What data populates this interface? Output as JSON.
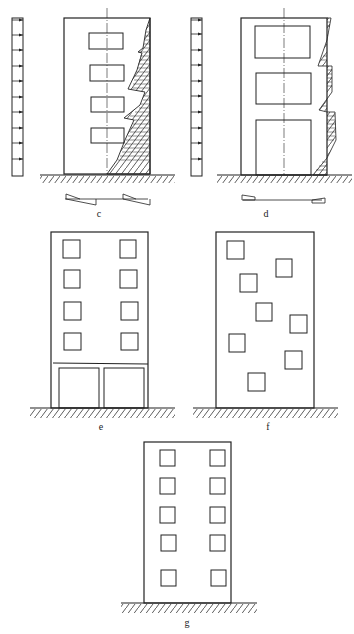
{
  "figure": {
    "panels": [
      {
        "id": "c",
        "label": "c",
        "description": "Frame wall with four small openings; wind load arrows on left, stress distribution diagram on right edge, section stress diagrams below"
      },
      {
        "id": "d",
        "label": "d",
        "description": "Wall with two large openings and tall door opening; wind load arrows on left, stress distribution diagram on right edge, section stress diagrams below"
      },
      {
        "id": "e",
        "label": "e",
        "description": "Building elevation with 2x4 regular windows and open ground floor (two large bays)"
      },
      {
        "id": "f",
        "label": "f",
        "description": "Building elevation with irregularly staggered windows"
      },
      {
        "id": "g",
        "label": "g",
        "description": "Building elevation with 2x5 regular window arrangement"
      }
    ]
  }
}
